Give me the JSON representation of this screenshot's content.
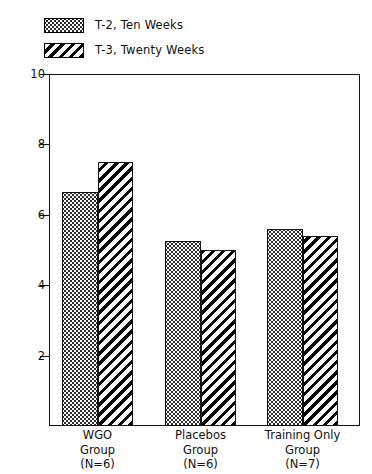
{
  "chart_data": {
    "type": "bar",
    "title": "",
    "xlabel": "",
    "ylabel": "Amplitude of T Wave  ( mm )",
    "ylim": [
      0,
      10
    ],
    "yticks": [
      2,
      4,
      6,
      8,
      10
    ],
    "ytick_labels": [
      "2",
      "4",
      "6",
      "8",
      "10"
    ],
    "grid": false,
    "legend_position": "above-plot-left",
    "categories": [
      "WGO Group (N=6)",
      "Placebos Group (N=6)",
      "Training Only Group (N=7)"
    ],
    "category_lines": [
      [
        "WGO",
        "Group",
        "(N=6)"
      ],
      [
        "Placebos",
        "Group",
        "(N=6)"
      ],
      [
        "Training Only",
        "Group",
        "(N=7)"
      ]
    ],
    "series": [
      {
        "name": "T-2, Ten Weeks",
        "pattern": "dots",
        "values": [
          6.65,
          5.27,
          5.6
        ]
      },
      {
        "name": "T-3, Twenty Weeks",
        "pattern": "hatch",
        "values": [
          7.5,
          5.0,
          5.4
        ]
      }
    ]
  },
  "legend": {
    "items": [
      {
        "label": "T-2, Ten Weeks",
        "pattern": "dots"
      },
      {
        "label": "T-3, Twenty Weeks",
        "pattern": "hatch"
      }
    ]
  },
  "axis": {
    "y_title": "Amplitude of T Wave  ( mm )",
    "y_ticks": [
      "10",
      "8",
      "6",
      "4",
      "2"
    ]
  },
  "colors": {
    "ink": "#111111",
    "background": "#ffffff",
    "pattern": "#000000"
  }
}
